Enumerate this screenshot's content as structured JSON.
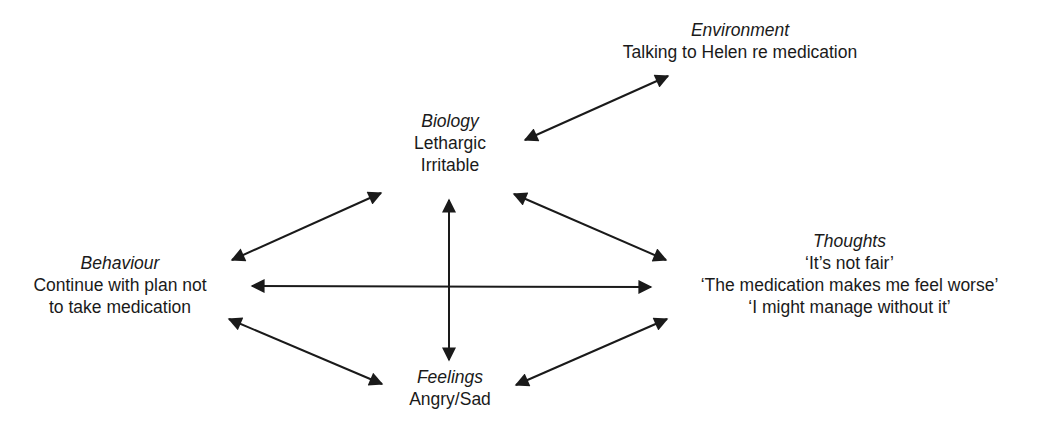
{
  "diagram": {
    "type": "five-areas-model",
    "nodes": {
      "environment": {
        "title": "Environment",
        "lines": [
          "Talking to Helen re medication"
        ]
      },
      "biology": {
        "title": "Biology",
        "lines": [
          "Lethargic",
          "Irritable"
        ]
      },
      "behaviour": {
        "title": "Behaviour",
        "lines": [
          "Continue with plan not",
          "to take medication"
        ]
      },
      "thoughts": {
        "title": "Thoughts",
        "lines": [
          "‘It’s not fair’",
          "‘The medication makes me feel worse’",
          "‘I might manage without it’"
        ]
      },
      "feelings": {
        "title": "Feelings",
        "lines": [
          "Angry/Sad"
        ]
      }
    },
    "edges": [
      {
        "from": "biology",
        "to": "environment",
        "bidirectional": true
      },
      {
        "from": "biology",
        "to": "behaviour",
        "bidirectional": true
      },
      {
        "from": "biology",
        "to": "thoughts",
        "bidirectional": true
      },
      {
        "from": "biology",
        "to": "feelings",
        "bidirectional": true
      },
      {
        "from": "behaviour",
        "to": "thoughts",
        "bidirectional": true
      },
      {
        "from": "behaviour",
        "to": "feelings",
        "bidirectional": true
      },
      {
        "from": "thoughts",
        "to": "feelings",
        "bidirectional": true
      }
    ],
    "colors": {
      "ink": "#1a1a1a",
      "background": "#ffffff"
    }
  }
}
